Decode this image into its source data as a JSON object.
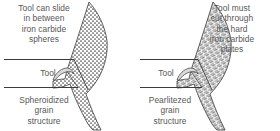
{
  "figure": {
    "type": "technical-diagram",
    "background_color": "#ffffff",
    "text_color": "#575757",
    "line_color": "#3a3a3a",
    "panel_count": 2
  },
  "panels": [
    {
      "id": "spheroidized",
      "side": "left",
      "note": "Tool can slide\nin between\niron carbide\nspheres",
      "tool_label": "Tool",
      "structure_label": "Spheroidized\ngrain\nstructure",
      "chip_texture": "stipple-dots",
      "texture_meaning": "iron carbide spheres"
    },
    {
      "id": "pearlitized",
      "side": "right",
      "note": "Tool must\ncut through\nthe hard\niron carbide\nplates",
      "tool_label": "Tool",
      "structure_label": "Pearlitezed\ngrain\nstructure",
      "chip_texture": "lamellar-hatch",
      "texture_meaning": "hard iron carbide plates"
    }
  ]
}
